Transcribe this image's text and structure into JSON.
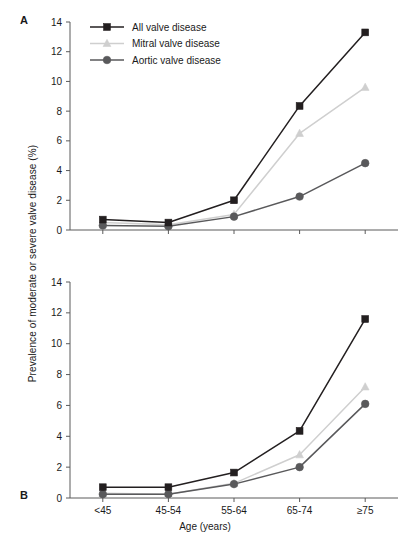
{
  "figure": {
    "y_axis_label": "Prevalence of moderate or severe valve disease (%)",
    "x_axis_label": "Age (years)",
    "panel_a_letter": "A",
    "panel_b_letter": "B"
  },
  "legend": {
    "items": [
      {
        "label": "All valve disease",
        "marker": "square",
        "color": "#231f20"
      },
      {
        "label": "Mitral valve disease",
        "marker": "triangle",
        "color": "#cfcfcf"
      },
      {
        "label": "Aortic valve disease",
        "marker": "circle",
        "color": "#59595b"
      }
    ]
  },
  "chart_data": [
    {
      "type": "line",
      "panel": "A",
      "title": "",
      "xlabel": "Age (years)",
      "ylabel": "Prevalence of moderate or severe valve disease (%)",
      "categories": [
        "<45",
        "45-54",
        "55-64",
        "65-74",
        "≥75"
      ],
      "ylim": [
        0,
        14
      ],
      "yticks": [
        0,
        2,
        4,
        6,
        8,
        10,
        12,
        14
      ],
      "grid": false,
      "legend_position": "top-left",
      "series": [
        {
          "name": "All valve disease",
          "marker": "square",
          "color": "#231f20",
          "values": [
            0.7,
            0.5,
            2.0,
            8.35,
            13.3
          ]
        },
        {
          "name": "Mitral valve disease",
          "marker": "triangle",
          "color": "#cfcfcf",
          "values": [
            0.5,
            0.35,
            1.05,
            6.5,
            9.6
          ]
        },
        {
          "name": "Aortic valve disease",
          "marker": "circle",
          "color": "#59595b",
          "values": [
            0.3,
            0.25,
            0.9,
            2.25,
            4.5
          ]
        }
      ]
    },
    {
      "type": "line",
      "panel": "B",
      "title": "",
      "xlabel": "Age (years)",
      "ylabel": "Prevalence of moderate or severe valve disease (%)",
      "categories": [
        "<45",
        "45-54",
        "55-64",
        "65-74",
        "≥75"
      ],
      "ylim": [
        0,
        14
      ],
      "yticks": [
        0,
        2,
        4,
        6,
        8,
        10,
        12,
        14
      ],
      "grid": false,
      "legend_position": "none",
      "series": [
        {
          "name": "All valve disease",
          "marker": "square",
          "color": "#231f20",
          "values": [
            0.7,
            0.7,
            1.65,
            4.35,
            11.6
          ]
        },
        {
          "name": "Mitral valve disease",
          "marker": "triangle",
          "color": "#cfcfcf",
          "values": [
            0.3,
            0.25,
            0.95,
            2.8,
            7.2
          ]
        },
        {
          "name": "Aortic valve disease",
          "marker": "circle",
          "color": "#59595b",
          "values": [
            0.25,
            0.25,
            0.9,
            2.0,
            6.1
          ]
        }
      ]
    }
  ]
}
